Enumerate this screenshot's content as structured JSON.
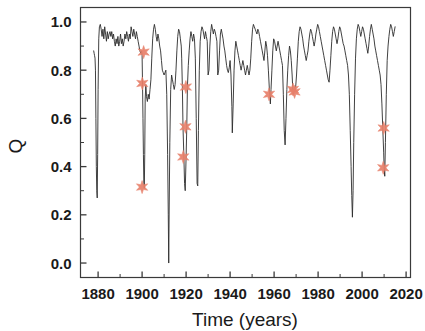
{
  "chart_data": {
    "type": "line",
    "title": "",
    "subtitle": "",
    "xlabel": "Time (years)",
    "ylabel": "Q",
    "xlim": [
      1872,
      2022
    ],
    "ylim": [
      -0.06,
      1.06
    ],
    "xticks": [
      1880,
      1900,
      1920,
      1940,
      1960,
      1980,
      2000,
      2020
    ],
    "xtick_labels": [
      "1880",
      "1900",
      "1920",
      "1940",
      "1960",
      "1980",
      "2000",
      "2020"
    ],
    "x_minor_ticks": [
      1890,
      1910,
      1930,
      1950,
      1970,
      1990,
      2010
    ],
    "yticks": [
      0.0,
      0.2,
      0.4,
      0.6,
      0.8,
      1.0
    ],
    "ytick_labels": [
      "0.0",
      "0.2",
      "0.4",
      "0.6",
      "0.8",
      "1.0"
    ],
    "y_minor_ticks": [
      0.1,
      0.3,
      0.5,
      0.7,
      0.9
    ],
    "grid": false,
    "legend": null,
    "legend_position": "none",
    "frame": "box",
    "series": [
      {
        "name": "Q",
        "type": "line",
        "color": "#2b2b2b",
        "linewidth": 0.9,
        "x": [
          1878.0,
          1878.2,
          1878.4,
          1878.6,
          1878.8,
          1879.0,
          1879.2,
          1879.4,
          1879.6,
          1879.8,
          1880.0,
          1880.3,
          1880.6,
          1881.0,
          1881.4,
          1881.8,
          1882.2,
          1882.6,
          1883.0,
          1883.4,
          1883.8,
          1884.2,
          1884.6,
          1885.0,
          1885.4,
          1885.8,
          1886.2,
          1886.6,
          1887.0,
          1887.4,
          1887.8,
          1888.2,
          1888.6,
          1889.0,
          1889.4,
          1889.8,
          1890.2,
          1890.6,
          1891.0,
          1891.4,
          1891.8,
          1892.2,
          1892.6,
          1893.0,
          1893.4,
          1893.8,
          1894.2,
          1894.6,
          1895.0,
          1895.4,
          1895.8,
          1896.2,
          1896.6,
          1897.0,
          1897.4,
          1897.8,
          1898.2,
          1898.6,
          1899.0,
          1899.4,
          1899.8,
          1900.0,
          1900.2,
          1900.4,
          1900.6,
          1900.8,
          1901.0,
          1901.2,
          1901.4,
          1901.7,
          1902.0,
          1902.4,
          1902.8,
          1903.2,
          1903.6,
          1904.0,
          1904.4,
          1904.8,
          1905.2,
          1905.6,
          1906.0,
          1906.4,
          1906.8,
          1907.2,
          1907.6,
          1908.0,
          1908.4,
          1908.8,
          1909.2,
          1909.6,
          1910.0,
          1910.4,
          1910.8,
          1911.2,
          1911.6,
          1911.9,
          1912.1,
          1912.3,
          1912.6,
          1913.0,
          1913.4,
          1913.8,
          1914.2,
          1914.6,
          1915.0,
          1915.4,
          1915.8,
          1916.2,
          1916.6,
          1917.0,
          1917.4,
          1917.8,
          1918.0,
          1918.3,
          1918.6,
          1919.0,
          1919.3,
          1919.6,
          1920.0,
          1920.3,
          1920.6,
          1921.0,
          1921.4,
          1921.8,
          1922.2,
          1922.6,
          1923.0,
          1923.4,
          1923.8,
          1924.2,
          1924.6,
          1925.0,
          1925.3,
          1925.6,
          1926.0,
          1926.4,
          1926.8,
          1927.2,
          1927.6,
          1928.0,
          1928.4,
          1928.8,
          1929.2,
          1929.6,
          1930.0,
          1930.4,
          1930.8,
          1931.2,
          1931.6,
          1932.0,
          1932.4,
          1932.8,
          1933.2,
          1933.6,
          1934.0,
          1934.4,
          1934.8,
          1935.2,
          1935.6,
          1936.0,
          1936.4,
          1936.8,
          1937.2,
          1937.6,
          1938.0,
          1938.4,
          1938.8,
          1939.2,
          1939.6,
          1940.0,
          1940.4,
          1940.8,
          1941.0,
          1941.4,
          1941.8,
          1942.2,
          1942.6,
          1943.0,
          1943.4,
          1943.8,
          1944.2,
          1944.6,
          1945.0,
          1945.4,
          1945.8,
          1946.2,
          1946.6,
          1947.0,
          1947.4,
          1947.8,
          1948.2,
          1948.6,
          1949.0,
          1949.4,
          1949.8,
          1950.2,
          1950.6,
          1951.0,
          1951.4,
          1951.8,
          1952.2,
          1952.6,
          1953.0,
          1953.4,
          1953.8,
          1954.2,
          1954.6,
          1955.0,
          1955.4,
          1955.8,
          1956.2,
          1956.6,
          1957.0,
          1957.4,
          1957.8,
          1958.0,
          1958.3,
          1958.6,
          1959.0,
          1959.4,
          1959.8,
          1960.2,
          1960.6,
          1961.0,
          1961.4,
          1961.8,
          1962.2,
          1962.6,
          1963.0,
          1963.4,
          1963.8,
          1964.2,
          1964.6,
          1965.0,
          1965.4,
          1965.8,
          1966.2,
          1966.6,
          1967.0,
          1967.4,
          1967.8,
          1968.2,
          1968.5,
          1968.8,
          1969.2,
          1969.5,
          1969.8,
          1970.2,
          1970.6,
          1971.0,
          1971.4,
          1971.8,
          1972.2,
          1972.6,
          1973.0,
          1973.4,
          1973.8,
          1974.2,
          1974.6,
          1975.0,
          1975.4,
          1975.8,
          1976.2,
          1976.6,
          1977.0,
          1977.4,
          1977.8,
          1978.2,
          1978.6,
          1979.0,
          1979.4,
          1979.8,
          1980.2,
          1980.6,
          1981.0,
          1981.4,
          1981.8,
          1982.2,
          1982.6,
          1983.0,
          1983.4,
          1983.8,
          1984.2,
          1984.6,
          1985.0,
          1985.4,
          1985.8,
          1986.2,
          1986.6,
          1987.0,
          1987.4,
          1987.8,
          1988.2,
          1988.6,
          1989.0,
          1989.4,
          1989.8,
          1990.2,
          1990.6,
          1991.0,
          1991.4,
          1991.8,
          1992.2,
          1992.6,
          1993.0,
          1993.4,
          1993.8,
          1994.2,
          1994.6,
          1995.0,
          1995.3,
          1995.6,
          1995.9,
          1996.2,
          1996.6,
          1997.0,
          1997.4,
          1997.8,
          1998.2,
          1998.6,
          1999.0,
          1999.4,
          1999.8,
          2000.2,
          2000.6,
          2001.0,
          2001.4,
          2001.8,
          2002.2,
          2002.6,
          2003.0,
          2003.4,
          2003.8,
          2004.2,
          2004.6,
          2005.0,
          2005.4,
          2005.8,
          2006.2,
          2006.6,
          2007.0,
          2007.4,
          2007.8,
          2008.2,
          2008.6,
          2009.0,
          2009.4,
          2009.8,
          2010.0,
          2010.3,
          2010.6,
          2011.0,
          2011.4,
          2011.8,
          2012.2,
          2012.6,
          2013.0,
          2013.4,
          2013.8,
          2014.2,
          2014.6,
          2015.0
        ],
        "y": [
          0.88,
          0.87,
          0.86,
          0.85,
          0.8,
          0.6,
          0.4,
          0.3,
          0.27,
          0.45,
          0.72,
          0.93,
          0.98,
          0.99,
          0.97,
          0.94,
          0.97,
          0.93,
          0.98,
          0.95,
          0.92,
          0.96,
          0.93,
          0.95,
          0.96,
          0.94,
          0.96,
          0.93,
          0.95,
          0.92,
          0.9,
          0.93,
          0.91,
          0.94,
          0.9,
          0.92,
          0.95,
          0.91,
          0.93,
          0.9,
          0.92,
          0.95,
          0.93,
          0.96,
          0.94,
          0.92,
          0.95,
          0.93,
          0.98,
          0.96,
          0.94,
          0.97,
          0.95,
          0.93,
          0.96,
          0.94,
          0.92,
          0.9,
          0.88,
          0.87,
          0.88,
          0.86,
          0.74,
          0.6,
          0.45,
          0.33,
          0.31,
          0.45,
          0.68,
          0.74,
          0.69,
          0.67,
          0.7,
          0.68,
          0.72,
          0.76,
          0.85,
          0.93,
          0.97,
          0.99,
          0.97,
          0.94,
          0.92,
          0.95,
          0.93,
          0.9,
          0.88,
          0.84,
          0.8,
          0.79,
          0.78,
          0.79,
          0.8,
          0.7,
          0.45,
          0.2,
          0.0,
          0.22,
          0.5,
          0.72,
          0.78,
          0.76,
          0.74,
          0.72,
          0.74,
          0.8,
          0.88,
          0.94,
          0.97,
          0.96,
          0.93,
          0.9,
          0.85,
          0.73,
          0.56,
          0.44,
          0.33,
          0.3,
          0.44,
          0.56,
          0.73,
          0.82,
          0.88,
          0.93,
          0.96,
          0.94,
          0.92,
          0.95,
          0.93,
          0.85,
          0.6,
          0.33,
          0.32,
          0.55,
          0.8,
          0.92,
          0.96,
          0.98,
          0.97,
          0.95,
          0.93,
          0.96,
          0.94,
          0.92,
          0.78,
          0.8,
          0.9,
          0.96,
          0.99,
          0.97,
          0.95,
          0.97,
          0.96,
          0.94,
          0.92,
          0.78,
          0.8,
          0.88,
          0.95,
          0.97,
          0.95,
          0.93,
          0.9,
          0.88,
          0.85,
          0.82,
          0.8,
          0.79,
          0.81,
          0.84,
          0.78,
          0.65,
          0.54,
          0.66,
          0.8,
          0.88,
          0.92,
          0.9,
          0.88,
          0.86,
          0.84,
          0.82,
          0.8,
          0.82,
          0.84,
          0.82,
          0.8,
          0.78,
          0.8,
          0.82,
          0.8,
          0.78,
          0.8,
          0.85,
          0.92,
          0.97,
          0.99,
          0.98,
          0.97,
          0.96,
          0.95,
          0.97,
          0.96,
          0.94,
          0.92,
          0.9,
          0.88,
          0.86,
          0.84,
          0.88,
          0.92,
          0.9,
          0.86,
          0.8,
          0.73,
          0.7,
          0.66,
          0.72,
          0.8,
          0.88,
          0.93,
          0.92,
          0.9,
          0.88,
          0.9,
          0.92,
          0.9,
          0.88,
          0.86,
          0.84,
          0.82,
          0.7,
          0.55,
          0.49,
          0.6,
          0.72,
          0.8,
          0.86,
          0.9,
          0.88,
          0.84,
          0.78,
          0.72,
          0.7,
          0.72,
          0.71,
          0.73,
          0.78,
          0.85,
          0.92,
          0.96,
          0.98,
          0.97,
          0.95,
          0.93,
          0.9,
          0.88,
          0.86,
          0.84,
          0.86,
          0.88,
          0.92,
          0.95,
          0.97,
          0.96,
          0.94,
          0.92,
          0.9,
          0.92,
          0.95,
          0.97,
          0.99,
          0.98,
          0.96,
          0.94,
          0.92,
          0.9,
          0.88,
          0.86,
          0.84,
          0.82,
          0.8,
          0.78,
          0.76,
          0.75,
          0.8,
          0.86,
          0.92,
          0.96,
          0.98,
          0.97,
          0.95,
          0.93,
          0.91,
          0.93,
          0.96,
          0.98,
          0.97,
          0.95,
          0.93,
          0.91,
          0.9,
          0.88,
          0.86,
          0.84,
          0.82,
          0.78,
          0.7,
          0.55,
          0.4,
          0.28,
          0.19,
          0.3,
          0.5,
          0.7,
          0.85,
          0.93,
          0.97,
          0.99,
          0.98,
          0.96,
          0.94,
          0.96,
          0.98,
          0.97,
          0.95,
          0.93,
          0.91,
          0.89,
          0.87,
          0.9,
          0.94,
          0.97,
          0.99,
          0.97,
          0.95,
          0.93,
          0.9,
          0.88,
          0.86,
          0.84,
          0.82,
          0.8,
          0.78,
          0.74,
          0.66,
          0.56,
          0.46,
          0.4,
          0.36,
          0.5,
          0.7,
          0.84,
          0.9,
          0.94,
          0.97,
          0.99,
          0.98,
          0.96,
          0.94,
          0.96,
          0.98
        ]
      },
      {
        "name": "Selected events",
        "type": "scatter",
        "marker": "star",
        "color": "#e8806a",
        "size": 6.5,
        "points": [
          {
            "x": 1900.7,
            "y": 0.875
          },
          {
            "x": 1900.1,
            "y": 0.745
          },
          {
            "x": 1900.0,
            "y": 0.315
          },
          {
            "x": 1919.9,
            "y": 0.73
          },
          {
            "x": 1919.7,
            "y": 0.565
          },
          {
            "x": 1918.7,
            "y": 0.44
          },
          {
            "x": 1957.7,
            "y": 0.7
          },
          {
            "x": 1968.6,
            "y": 0.72
          },
          {
            "x": 1969.3,
            "y": 0.71
          },
          {
            "x": 2009.8,
            "y": 0.56
          },
          {
            "x": 2009.6,
            "y": 0.395
          }
        ]
      }
    ]
  },
  "axes": {
    "x_title": "Time (years)",
    "y_title": "Q"
  }
}
